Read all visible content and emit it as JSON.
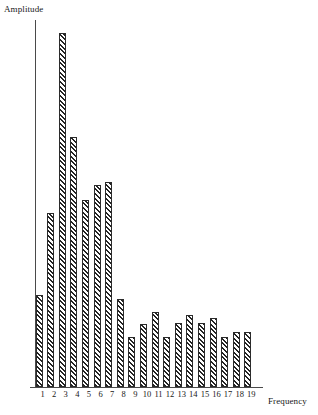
{
  "chart_data": {
    "type": "bar",
    "title": "",
    "subtitle": "",
    "xlabel": "Frequency",
    "ylabel": "Amplitude",
    "categories": [
      "1",
      "2",
      "3",
      "4",
      "5",
      "6",
      "7",
      "8",
      "9",
      "10",
      "11",
      "12",
      "13",
      "14",
      "15",
      "16",
      "17",
      "18",
      "19"
    ],
    "values": [
      93,
      175,
      357,
      252,
      189,
      204,
      207,
      89,
      50,
      64,
      76,
      50,
      65,
      73,
      65,
      70,
      50,
      55,
      55
    ],
    "ylim": [
      0,
      370
    ],
    "grid": false,
    "legend": null,
    "series": [
      {
        "name": "Amplitude",
        "values": [
          93,
          175,
          357,
          252,
          189,
          204,
          207,
          89,
          50,
          64,
          76,
          50,
          65,
          73,
          65,
          70,
          50,
          55,
          55
        ]
      }
    ],
    "bar_fill": "diagonal-hatch",
    "bar_edge_color": "#2b2b2b",
    "axis_color": "#4a4a4a",
    "background_color": "#ffffff"
  },
  "axes": {
    "y_label": "Amplitude",
    "x_label": "Frequency"
  },
  "ticks": {
    "x": [
      "1",
      "2",
      "3",
      "4",
      "5",
      "6",
      "7",
      "8",
      "9",
      "10",
      "11",
      "12",
      "13",
      "14",
      "15",
      "16",
      "17",
      "18",
      "19"
    ],
    "y": []
  }
}
